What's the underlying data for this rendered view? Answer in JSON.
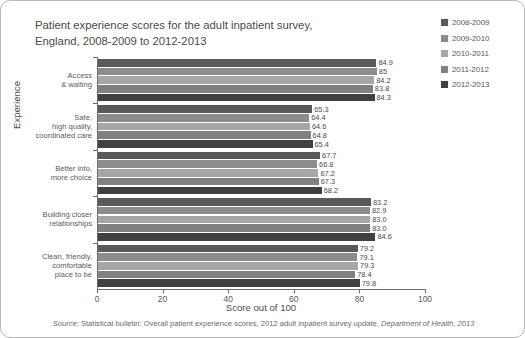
{
  "title": {
    "line1": "Patient experience scores for the adult inpatient survey,",
    "line2": "England, 2008-2009 to 2012-2013"
  },
  "legend": {
    "position": "top-right",
    "entries": [
      {
        "label": "2008-2009",
        "color": "#595959"
      },
      {
        "label": "2009-2010",
        "color": "#8c8c8c"
      },
      {
        "label": "2010-2011",
        "color": "#a6a6a6"
      },
      {
        "label": "2011-2012",
        "color": "#808080"
      },
      {
        "label": "2012-2013",
        "color": "#404040"
      }
    ]
  },
  "axes": {
    "x_title": "Score out of 100",
    "y_title": "Experience",
    "x_ticks": [
      "0",
      "20",
      "40",
      "60",
      "80",
      "100"
    ]
  },
  "footer": {
    "source_prefix": "Source:",
    "source_body": " Statistical bulletin: Overall patient experience scores, 2012 adult inpatient survey update, ",
    "source_suffix": "Department of Health, 2013"
  },
  "chart_data": {
    "type": "bar",
    "orientation": "horizontal",
    "title": "Patient experience scores for the adult inpatient survey, England, 2008-2009 to 2012-2013",
    "xlabel": "Score out of 100",
    "ylabel": "Experience",
    "xlim": [
      0,
      100
    ],
    "xticks": [
      0,
      20,
      40,
      60,
      80,
      100
    ],
    "grid": false,
    "legend_position": "top-right",
    "categories": [
      "Access & waiting",
      "Safe, high quality, coordinated care",
      "Better info, more choice",
      "Building closer relationships",
      "Clean, friendly, comfortable place to be"
    ],
    "category_lines": [
      [
        "Access",
        "& waiting"
      ],
      [
        "Safe,",
        "high quality,",
        "coordinated care"
      ],
      [
        "Better info,",
        "more choice"
      ],
      [
        "Building closer",
        "relationships"
      ],
      [
        "Clean, friendly,",
        "comfortable",
        "place to be"
      ]
    ],
    "series": [
      {
        "name": "2008-2009",
        "color": "#595959",
        "values": [
          84.9,
          65.3,
          67.7,
          83.2,
          79.2
        ]
      },
      {
        "name": "2009-2010",
        "color": "#8c8c8c",
        "values": [
          85,
          64.4,
          66.8,
          82.9,
          79.1
        ]
      },
      {
        "name": "2010-2011",
        "color": "#a6a6a6",
        "values": [
          84.2,
          64.6,
          67.2,
          83.0,
          79.3
        ]
      },
      {
        "name": "2011-2012",
        "color": "#808080",
        "values": [
          83.8,
          64.8,
          67.3,
          83.0,
          78.4
        ]
      },
      {
        "name": "2012-2013",
        "color": "#404040",
        "values": [
          84.3,
          65.4,
          68.2,
          84.6,
          79.8
        ]
      }
    ],
    "value_labels": [
      [
        "84.9",
        "85",
        "84.2",
        "83.8",
        "84.3"
      ],
      [
        "65.3",
        "64.4",
        "64.6",
        "64.8",
        "65.4"
      ],
      [
        "67.7",
        "66.8",
        "67.2",
        "67.3",
        "68.2"
      ],
      [
        "83.2",
        "82.9",
        "83.0",
        "83.0",
        "84.6"
      ],
      [
        "79.2",
        "79.1",
        "79.3",
        "78.4",
        "79.8"
      ]
    ]
  }
}
